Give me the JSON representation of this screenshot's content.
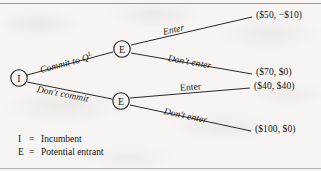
{
  "figure": {
    "type": "game-tree"
  },
  "nodes": [
    {
      "id": "I",
      "label": "I",
      "player": "Incumbent",
      "x": 19,
      "y": 78
    },
    {
      "id": "E1",
      "label": "E",
      "player": "Potential entrant",
      "x": 122,
      "y": 49
    },
    {
      "id": "E2",
      "label": "E",
      "player": "Potential entrant",
      "x": 121,
      "y": 101
    }
  ],
  "edges": [
    {
      "id": "commit",
      "label": "Commit to Q",
      "superscript": "L",
      "from": "I",
      "to": "E1"
    },
    {
      "id": "dont-commit",
      "label": "Don't commit",
      "superscript": "",
      "from": "I",
      "to": "E2"
    },
    {
      "id": "enter-top",
      "label": "Enter",
      "superscript": "",
      "from": "E1",
      "to": "payoff1"
    },
    {
      "id": "dont-enter-top",
      "label": "Don't enter",
      "superscript": "",
      "from": "E1",
      "to": "payoff2"
    },
    {
      "id": "enter-bottom",
      "label": "Enter",
      "superscript": "",
      "from": "E2",
      "to": "payoff3"
    },
    {
      "id": "dont-enter-bottom",
      "label": "Don't enter",
      "superscript": "",
      "from": "E2",
      "to": "payoff4"
    }
  ],
  "payoffs": [
    {
      "id": "payoff1",
      "text": "($50, −$10)",
      "incumbent": "$50",
      "entrant": "−$10"
    },
    {
      "id": "payoff2",
      "text": "($70, $0)",
      "incumbent": "$70",
      "entrant": "$0"
    },
    {
      "id": "payoff3",
      "text": "($40, $40)",
      "incumbent": "$40",
      "entrant": "$40"
    },
    {
      "id": "payoff4",
      "text": "($100, $0)",
      "incumbent": "$100",
      "entrant": "$0"
    }
  ],
  "legend": [
    {
      "key": "I",
      "eq": "=",
      "text": "Incumbent"
    },
    {
      "key": "E",
      "eq": "=",
      "text": "Potential entrant"
    }
  ],
  "colors": {
    "background": "#f6f5f3",
    "ink": "#1b1b1b",
    "line": "#2a2a2a",
    "border": "#8e8d89"
  }
}
